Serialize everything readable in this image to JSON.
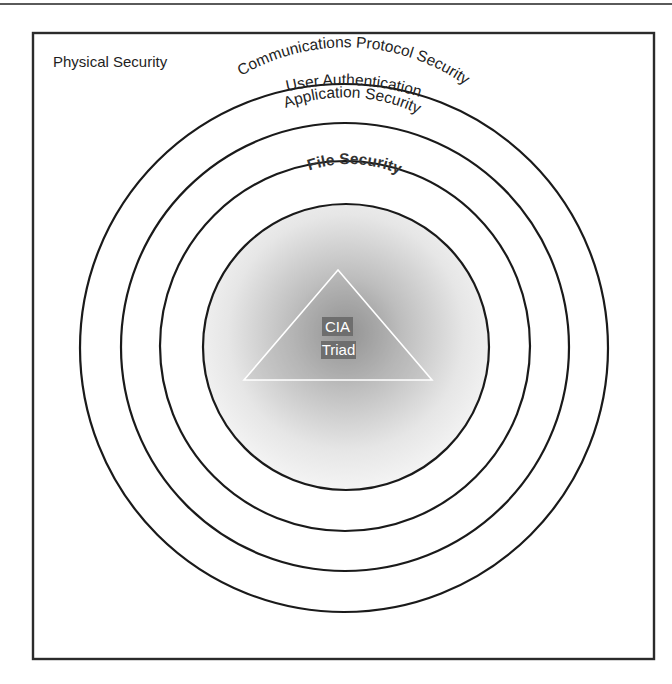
{
  "diagram": {
    "outer_label": "Physical Security",
    "rings": [
      {
        "label": "User Authentication",
        "radius": 264
      },
      {
        "label": "Communications Protocol Security",
        "radius": 224
      },
      {
        "label": "Application Security",
        "radius": 185
      },
      {
        "label": "File Security",
        "radius": 143
      }
    ],
    "core": {
      "line1": "CIA",
      "line2": "Triad"
    },
    "colors": {
      "stroke": "#1a1a1a",
      "core_gradient_center": "#9a9a9a",
      "core_gradient_edge": "#f2f2f2",
      "triangle_stroke": "#ffffff",
      "label_bg": "#6e6e6e"
    }
  }
}
